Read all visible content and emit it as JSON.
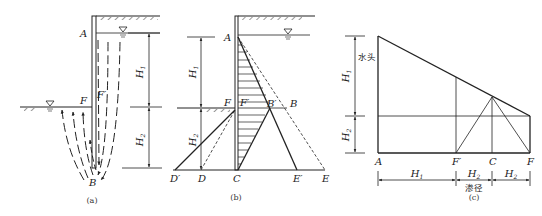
{
  "figures": [
    {
      "id": "a",
      "caption": "(a)",
      "description": "Seepage flow around sheet pile wall",
      "labels": {
        "A": "A",
        "F": "F",
        "F_prime": "F′",
        "B": "B"
      },
      "dimensions": [
        {
          "symbol": "H",
          "subscript": "1"
        },
        {
          "symbol": "H",
          "subscript": "2"
        }
      ]
    },
    {
      "id": "b",
      "caption": "(b)",
      "description": "Water pressure distribution on wall",
      "labels": {
        "A": "A",
        "F": "F",
        "F_prime": "F′",
        "B": "B",
        "B_prime": "B′",
        "C": "C",
        "D": "D",
        "D_prime": "D′",
        "E": "E",
        "E_prime": "E′"
      },
      "dimensions": [
        {
          "symbol": "H",
          "subscript": "1"
        },
        {
          "symbol": "H",
          "subscript": "2"
        }
      ]
    },
    {
      "id": "c",
      "caption": "(c)",
      "description": "Head loss along seepage path",
      "head_label": "水头",
      "path_label": "渗径",
      "labels": {
        "A": "A",
        "F_prime": "F′",
        "C": "C",
        "F": "F"
      },
      "vertical_dimensions": [
        {
          "symbol": "H",
          "subscript": "1"
        },
        {
          "symbol": "H",
          "subscript": "2"
        }
      ],
      "horizontal_dimensions": [
        {
          "symbol": "H",
          "subscript": "1"
        },
        {
          "symbol": "H",
          "subscript": "2"
        },
        {
          "symbol": "H",
          "subscript": "2"
        }
      ]
    }
  ]
}
